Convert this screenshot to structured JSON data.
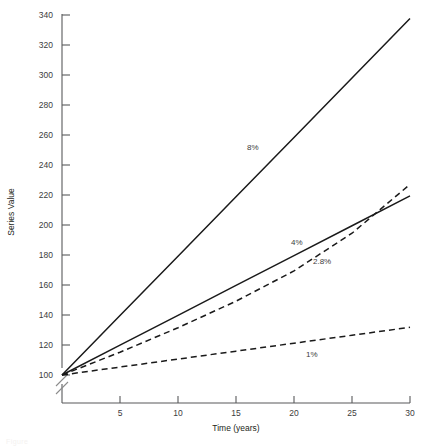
{
  "chart_data": {
    "type": "line",
    "title": "",
    "xlabel": "Time (years)",
    "ylabel": "Series Value",
    "xlim": [
      0,
      30
    ],
    "ylim": [
      100,
      340
    ],
    "grid": false,
    "legend": "inline-annotations",
    "y_axis_break": true,
    "x_ticks": [
      5,
      10,
      15,
      20,
      25,
      30
    ],
    "y_ticks": [
      100,
      120,
      140,
      160,
      180,
      200,
      220,
      240,
      260,
      280,
      300,
      320,
      340
    ],
    "x": [
      0,
      5,
      10,
      15,
      20,
      25,
      30
    ],
    "series": [
      {
        "name": "8%",
        "rate_percent": 8,
        "style": "solid",
        "label": "8%",
        "values": [
          100,
          139.6,
          179.2,
          218.8,
          258.4,
          298.0,
          337.6
        ]
      },
      {
        "name": "4%",
        "rate_percent": 4,
        "style": "solid",
        "label": "4%",
        "values": [
          100,
          119.9,
          139.8,
          159.7,
          179.6,
          199.5,
          219.4
        ]
      },
      {
        "name": "2.8%",
        "rate_percent": 2.8,
        "style": "dashed",
        "label": "2.8%",
        "values": [
          100,
          115.2,
          131.5,
          149.2,
          169.4,
          194.5,
          227.1
        ]
      },
      {
        "name": "1%",
        "rate_percent": 1,
        "style": "dashed",
        "label": "1%",
        "values": [
          100,
          105.3,
          110.6,
          115.9,
          121.2,
          126.5,
          131.8
        ]
      }
    ],
    "annotations": [
      {
        "text": "8%",
        "x_px": 247,
        "y_px": 150
      },
      {
        "text": "4%",
        "x_px": 291,
        "y_px": 245
      },
      {
        "text": "2.8%",
        "x_px": 313,
        "y_px": 264
      },
      {
        "text": "1%",
        "x_px": 306,
        "y_px": 357
      }
    ]
  },
  "axis": {
    "y_title": "Series Value",
    "x_title": "Time (years)",
    "y_tick_labels": [
      "340",
      "320",
      "300",
      "280",
      "260",
      "240",
      "220",
      "200",
      "180",
      "160",
      "140",
      "120",
      "100"
    ],
    "x_tick_labels": [
      "5",
      "10",
      "15",
      "20",
      "25",
      "30"
    ]
  }
}
